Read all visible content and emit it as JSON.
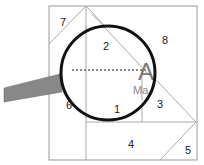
{
  "diagram": {
    "regions": [
      {
        "id": "1",
        "label": "1"
      },
      {
        "id": "2",
        "label": "2"
      },
      {
        "id": "3",
        "label": "3"
      },
      {
        "id": "4",
        "label": "4"
      },
      {
        "id": "5",
        "label": "5"
      },
      {
        "id": "6",
        "label": "6"
      },
      {
        "id": "7",
        "label": "7"
      },
      {
        "id": "8",
        "label": "8"
      }
    ],
    "magnified_letter": "A",
    "magnified_text": "Ma",
    "colors": {
      "outline": "#999999",
      "lens_rim": "#111111",
      "handle": "#888888",
      "dotted_line": "#888888"
    }
  }
}
